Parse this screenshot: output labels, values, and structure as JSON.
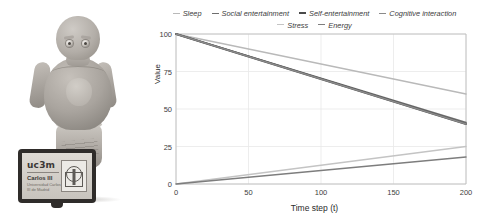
{
  "figure": {
    "photo": {
      "name": "social-robot-photo",
      "robot_label": "social robot",
      "tablet": {
        "brand": "uc3m",
        "university": "Carlos III",
        "subtitle": "Universidad Carlos III de Madrid",
        "emblem": "vitruvian-man-emblem"
      }
    }
  },
  "chart_data": {
    "type": "line",
    "title": "",
    "xlabel": "Time step (t)",
    "ylabel": "Value",
    "xlim": [
      0,
      200
    ],
    "ylim": [
      0,
      100
    ],
    "xticks": [
      0,
      50,
      100,
      150,
      200
    ],
    "yticks": [
      0,
      25,
      50,
      75,
      100
    ],
    "grid": true,
    "legend_position": "top",
    "x": [
      0,
      200
    ],
    "series": [
      {
        "name": "Sleep",
        "color": "#b9b9b9",
        "width": 1.3,
        "values": [
          100,
          60
        ]
      },
      {
        "name": "Social entertainment",
        "color": "#6e6e6e",
        "width": 1.6,
        "values": [
          100,
          41
        ]
      },
      {
        "name": "Self-entertainment",
        "color": "#4a4a4a",
        "width": 2.0,
        "values": [
          100,
          40
        ]
      },
      {
        "name": "Cognitive interaction",
        "color": "#8a8a8a",
        "width": 1.5,
        "values": [
          100,
          40
        ]
      },
      {
        "name": "Stress",
        "color": "#c4c4c4",
        "width": 1.3,
        "values": [
          0,
          25
        ]
      },
      {
        "name": "Energy",
        "color": "#7d7d7d",
        "width": 1.4,
        "values": [
          0,
          18
        ]
      }
    ]
  }
}
